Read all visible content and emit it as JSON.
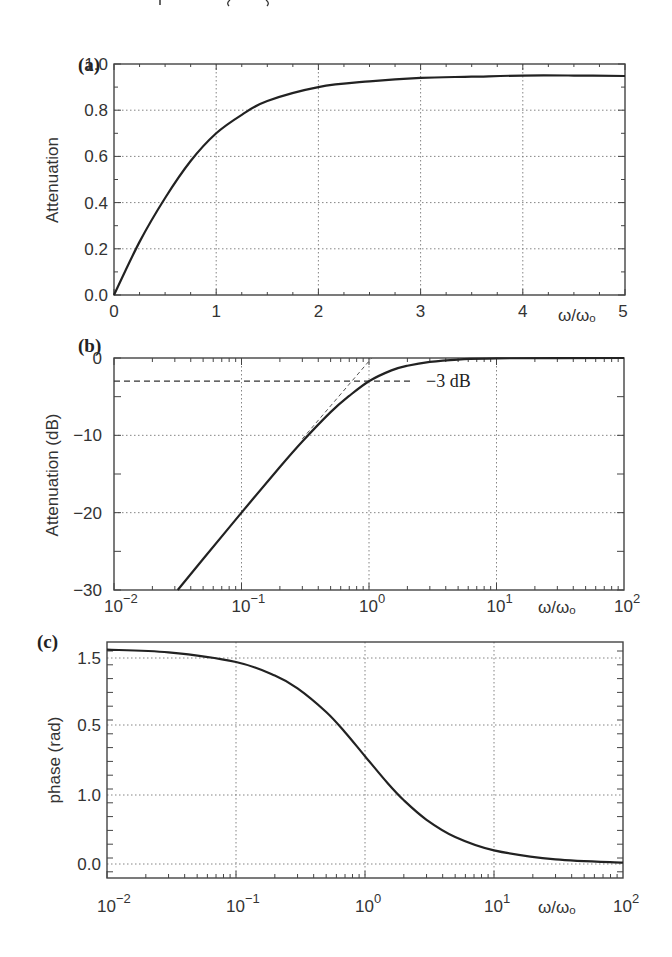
{
  "header_fragment": {
    "text": "√ … (ω₀)"
  },
  "chart_data": [
    {
      "panel": "(a)",
      "type": "line",
      "title": "",
      "xlabel": "ω/ω₀",
      "ylabel": "Attenuation",
      "xscale": "linear",
      "xlim": [
        0,
        5
      ],
      "ylim": [
        0.0,
        1.0
      ],
      "grid": true,
      "xticks": [
        "0",
        "1",
        "2",
        "3",
        "4",
        "5"
      ],
      "yticks": [
        "0.0",
        "0.2",
        "0.4",
        "0.6",
        "0.8",
        "1.0"
      ],
      "series": [
        {
          "name": "attenuation",
          "x": [
            0,
            0.25,
            0.5,
            0.75,
            1.0,
            1.25,
            1.5,
            2.0,
            2.5,
            3.0,
            3.5,
            4.0,
            4.5,
            5.0
          ],
          "y": [
            0.0,
            0.23,
            0.42,
            0.58,
            0.7,
            0.78,
            0.84,
            0.9,
            0.925,
            0.94,
            0.945,
            0.95,
            0.95,
            0.948
          ]
        }
      ]
    },
    {
      "panel": "(b)",
      "type": "line",
      "title": "",
      "xlabel": "ω/ω₀",
      "ylabel": "Attenuation (dB)",
      "xscale": "log",
      "xlim": [
        0.01,
        100
      ],
      "ylim": [
        -30,
        0
      ],
      "grid": true,
      "xticks": [
        "10⁻²",
        "10⁻¹",
        "10⁰",
        "10¹",
        "10²"
      ],
      "yticks": [
        "0",
        "-10",
        "-20",
        "-30"
      ],
      "annotations": [
        {
          "text": "−3 dB",
          "x": 2.2,
          "y": -3,
          "style": "dashed horizontal line from x=0.01 to ~2"
        },
        {
          "text": "",
          "style": "dashed asymptote 20 dB/decade through (1, 0)"
        }
      ],
      "series": [
        {
          "name": "attenuation_dB",
          "x": [
            0.0316,
            0.05,
            0.1,
            0.2,
            0.3,
            0.5,
            0.7,
            1.0,
            1.5,
            2.0,
            3.0,
            5.0,
            10,
            100
          ],
          "y": [
            -30,
            -26.0,
            -20.0,
            -14.1,
            -10.8,
            -7.0,
            -4.9,
            -3.0,
            -1.6,
            -1.0,
            -0.5,
            -0.2,
            -0.04,
            0.0
          ]
        }
      ]
    },
    {
      "panel": "(c)",
      "type": "line",
      "title": "",
      "xlabel": "ω/ω₀",
      "ylabel": "phase  (rad)",
      "xscale": "log",
      "xlim": [
        0.01,
        100
      ],
      "ylim": [
        -0.1,
        1.6
      ],
      "grid": true,
      "xticks": [
        "10⁻²",
        "10⁻¹",
        "10⁰",
        "10¹",
        "10²"
      ],
      "yticks": [
        "1.5",
        "0.5",
        "1.0",
        "0.0"
      ],
      "series": [
        {
          "name": "phase",
          "x": [
            0.01,
            0.03,
            0.1,
            0.2,
            0.3,
            0.5,
            0.7,
            1.0,
            1.5,
            2.0,
            3.0,
            5.0,
            10,
            30,
            100
          ],
          "y": [
            1.561,
            1.541,
            1.471,
            1.373,
            1.279,
            1.107,
            0.96,
            0.785,
            0.588,
            0.464,
            0.322,
            0.197,
            0.0997,
            0.0333,
            0.01
          ]
        }
      ]
    }
  ],
  "panels": {
    "a": {
      "label": "(a)",
      "ylabel": "Attenuation",
      "xlabel": "ω/ωₒ",
      "xticks": [
        "0",
        "1",
        "2",
        "3",
        "4",
        "5"
      ],
      "yticks": [
        "0.0",
        "0.2",
        "0.4",
        "0.6",
        "0.8",
        "1.0"
      ]
    },
    "b": {
      "label": "(b)",
      "ylabel": "Attenuation (dB)",
      "xlabel": "ω/ωₒ",
      "xtick_base": "10",
      "xtick_exps": [
        "−2",
        "−1",
        "0",
        "1",
        "2"
      ],
      "yticks": [
        "0",
        "−10",
        "−20",
        "−30"
      ],
      "annotation": "−3 dB"
    },
    "c": {
      "label": "(c)",
      "ylabel": "phase  (rad)",
      "xlabel": "ω/ωₒ",
      "xtick_base": "10",
      "xtick_exps": [
        "−2",
        "−1",
        "0",
        "1",
        "2"
      ],
      "yticks": [
        "1.5",
        "0.5",
        "1.0",
        "0.0"
      ]
    }
  }
}
